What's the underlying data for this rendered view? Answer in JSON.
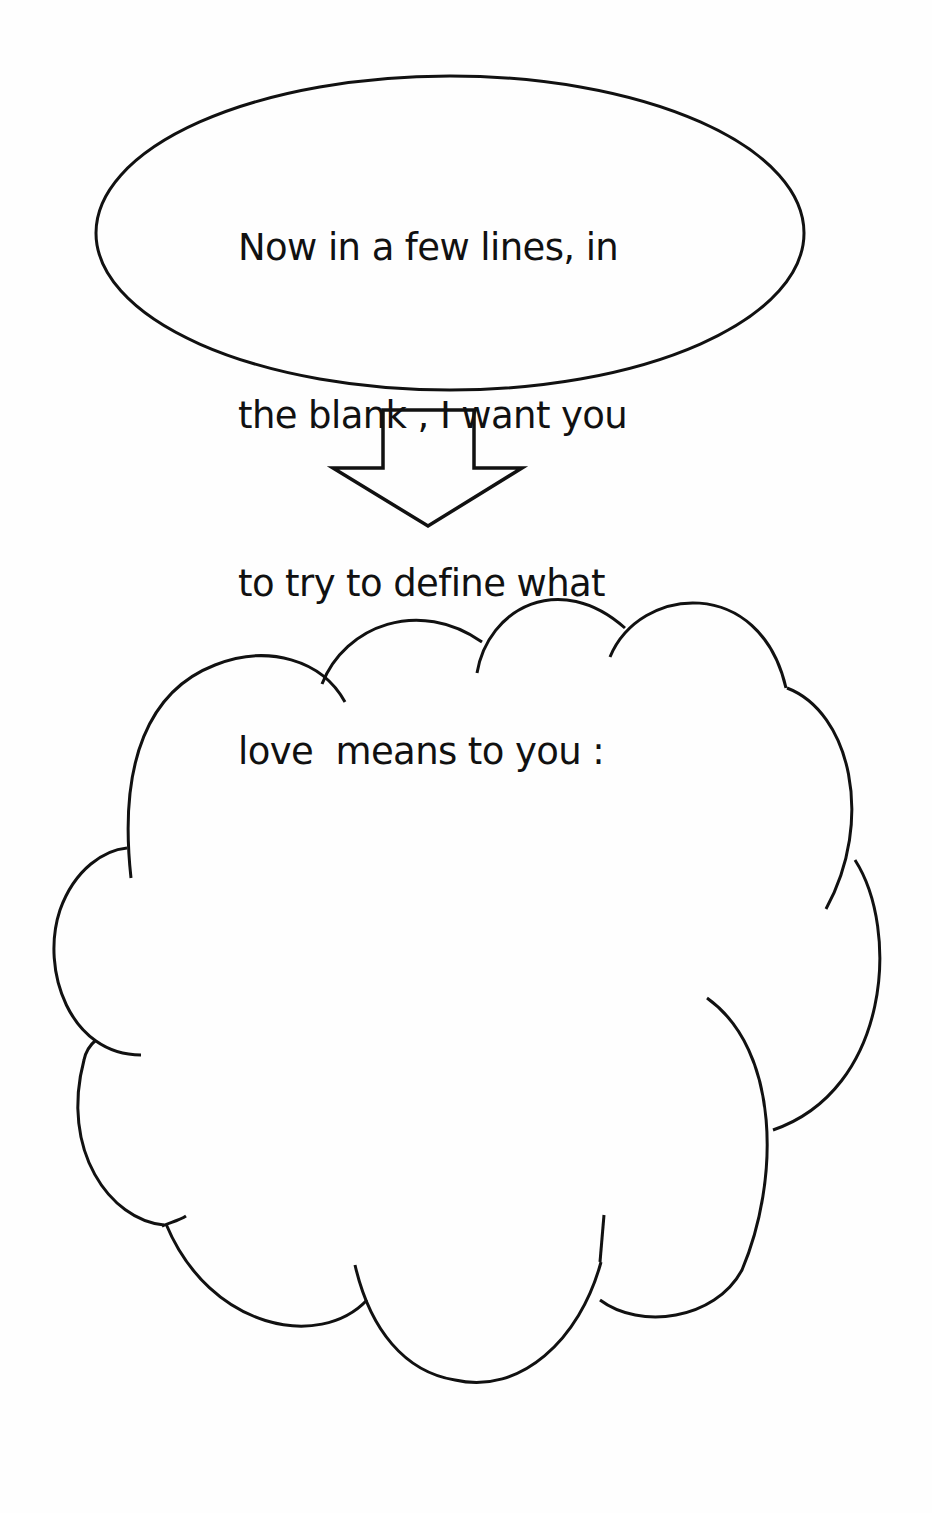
{
  "worksheet": {
    "prompt_lines": [
      "Now in a few lines, in",
      "the blank , I want you",
      "to try to define what",
      "love  means to you :"
    ],
    "answer_value": "",
    "shapes": {
      "prompt_bubble": "ellipse",
      "pointer": "down-arrow-icon",
      "answer_area": "cloud"
    },
    "colors": {
      "ink": "#111111",
      "paper": "#fefefe"
    }
  }
}
